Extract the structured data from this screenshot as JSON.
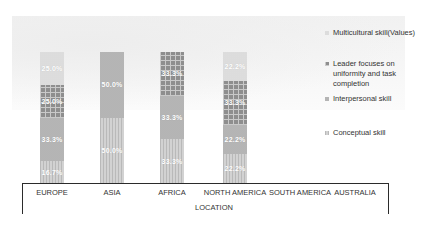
{
  "chart_data": {
    "type": "bar",
    "stacked": true,
    "percent_stacked": true,
    "title": "",
    "xlabel": "LOCATION",
    "ylabel": "",
    "categories": [
      "EUROPE",
      "ASIA",
      "AFRICA",
      "NORTH AMERICA",
      "SOUTH AMERICA",
      "AUSTRALIA"
    ],
    "series": [
      {
        "name": "Conceptual skill",
        "values": [
          16.7,
          50.0,
          33.3,
          22.2,
          0,
          0
        ],
        "labels": [
          "16.7%",
          "50.0%",
          "33.3%",
          "22.2%",
          "",
          ""
        ],
        "color": "#d2d2d2"
      },
      {
        "name": "Interpersonal skill",
        "values": [
          33.3,
          50.0,
          33.3,
          22.2,
          0,
          0
        ],
        "labels": [
          "33.3%",
          "50.0%",
          "33.3%",
          "22.2%",
          "",
          ""
        ],
        "color": "#bdbdbd"
      },
      {
        "name": "Leader focuses on uniformity and task completion",
        "values": [
          25.0,
          0,
          33.3,
          33.3,
          0,
          0
        ],
        "labels": [
          "25.0%",
          "",
          "33.3%",
          "33.3%",
          "",
          ""
        ],
        "color": "#8e8e8e"
      },
      {
        "name": "Multicultural skill(Values)",
        "values": [
          25.0,
          0,
          0,
          22.2,
          0,
          0
        ],
        "labels": [
          "25.0%",
          "",
          "",
          "22.2%",
          "",
          ""
        ],
        "color": "#e3e3e3"
      }
    ],
    "ylim": [
      0,
      100
    ],
    "grid": false,
    "legend_position": "right"
  },
  "legend": {
    "items": [
      {
        "label": "Multicultural skill(Values)"
      },
      {
        "label": "Leader focuses on uniformity and task completion"
      },
      {
        "label": "Interpersonal skill"
      },
      {
        "label": "Conceptual skill"
      }
    ]
  },
  "axis": {
    "xlabel": "LOCATION",
    "categories": [
      "EUROPE",
      "ASIA",
      "AFRICA",
      "NORTH AMERICA",
      "SOUTH AMERICA",
      "AUSTRALIA"
    ]
  }
}
